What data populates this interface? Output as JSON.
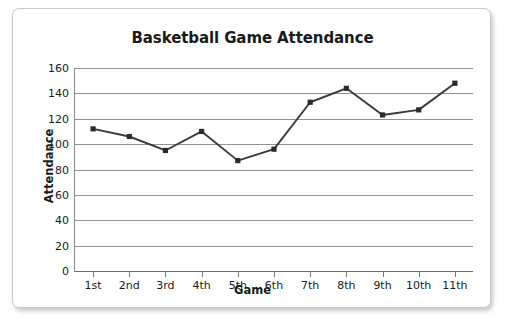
{
  "chart_data": {
    "type": "line",
    "title": "Basketball Game Attendance",
    "xlabel": "Game",
    "ylabel": "Attendance",
    "categories": [
      "1st",
      "2nd",
      "3rd",
      "4th",
      "5th",
      "6th",
      "7th",
      "8th",
      "9th",
      "10th",
      "11th"
    ],
    "values": [
      112,
      106,
      95,
      110,
      87,
      96,
      133,
      144,
      123,
      127,
      148
    ],
    "series": [
      {
        "name": "Attendance",
        "values": [
          112,
          106,
          95,
          110,
          87,
          96,
          133,
          144,
          123,
          127,
          148
        ]
      }
    ],
    "ylim": [
      0,
      160
    ],
    "ytick_step": 20,
    "yticks": [
      160,
      140,
      120,
      100,
      80,
      60,
      40,
      20,
      0
    ],
    "grid": "horizontal",
    "legend": "none",
    "marker": "square",
    "line_color": "#3a3a3a",
    "marker_color": "#2b2b2b",
    "grid_color": "#939393",
    "axis_color": "#8a8a8a",
    "text_color": "#1a1a1a",
    "background": "#ffffff"
  }
}
